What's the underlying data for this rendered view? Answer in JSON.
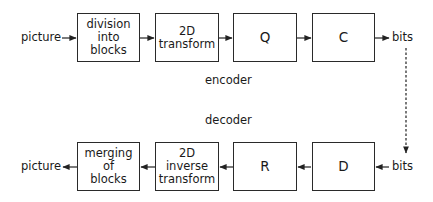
{
  "encoder": {
    "label": "encoder",
    "input": "picture",
    "output": "bits",
    "blocks": [
      {
        "id": "division",
        "label": "division\ninto\nblocks"
      },
      {
        "id": "transform",
        "label": "2D\ntransform"
      },
      {
        "id": "quantizer",
        "label": "Q"
      },
      {
        "id": "coder",
        "label": "C"
      }
    ]
  },
  "decoder": {
    "label": "decoder",
    "input": "bits",
    "output": "picture",
    "blocks": [
      {
        "id": "merging",
        "label": "merging\nof\nblocks"
      },
      {
        "id": "inverse-transform",
        "label": "2D\ninverse\ntransform"
      },
      {
        "id": "reconstruction",
        "label": "R"
      },
      {
        "id": "decoding",
        "label": "D"
      }
    ]
  },
  "channel": {
    "style": "dashed",
    "direction": "down"
  }
}
